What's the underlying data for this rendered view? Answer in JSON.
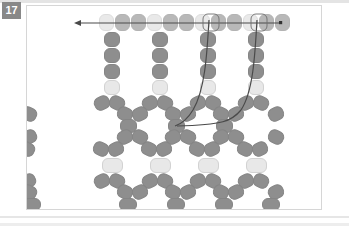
{
  "figure": {
    "step_number": "17",
    "caption": "",
    "panel_background": "#ffffff",
    "panel_border_color": "#d6d6d6"
  },
  "colors": {
    "bead_dark": "#8e8e8e",
    "bead_light": "#dcdcdc",
    "bead_pale": "#e8e8e8",
    "thread": "#4a4a4a",
    "badge_background": "#888888",
    "badge_text": "#ffffff",
    "rule": "#e4e4e4"
  },
  "diagram": {
    "type": "beadwork-stitch-diagram",
    "thread_direction": "right-to-left",
    "arrow_head": "left",
    "needle_end_marker": "dot",
    "rows": [
      {
        "name": "top-row",
        "style": "ghost",
        "y": 8,
        "beads": [
          {
            "x": 98,
            "tone": "light"
          },
          {
            "x": 114,
            "tone": "dark"
          },
          {
            "x": 130,
            "tone": "dark"
          },
          {
            "x": 146,
            "tone": "light"
          },
          {
            "x": 162,
            "tone": "dark"
          },
          {
            "x": 178,
            "tone": "dark"
          },
          {
            "x": 194,
            "tone": "light"
          },
          {
            "x": 210,
            "tone": "dark"
          },
          {
            "x": 226,
            "tone": "dark"
          },
          {
            "x": 242,
            "tone": "light"
          },
          {
            "x": 258,
            "tone": "dark"
          },
          {
            "x": 274,
            "tone": "dark"
          }
        ]
      },
      {
        "name": "vertical-columns",
        "columns": [
          {
            "x": 103,
            "beads": [
              "dark",
              "dark",
              "dark",
              "pale"
            ]
          },
          {
            "x": 151,
            "beads": [
              "dark",
              "dark",
              "dark",
              "pale"
            ]
          },
          {
            "x": 199,
            "beads": [
              "dark",
              "dark",
              "dark",
              "pale"
            ]
          },
          {
            "x": 247,
            "beads": [
              "dark",
              "dark",
              "dark",
              "pale"
            ]
          }
        ],
        "bead_tone_bottom": "pale"
      },
      {
        "name": "net-body",
        "tone": "dark",
        "description": "diamond netting lattice of angled dark beads"
      },
      {
        "name": "accent-row",
        "tone": "pale",
        "y": 152,
        "x_positions": [
          104,
          152,
          200,
          248
        ]
      }
    ],
    "legend": {
      "dark_bead_label": "",
      "light_bead_label": ""
    }
  }
}
